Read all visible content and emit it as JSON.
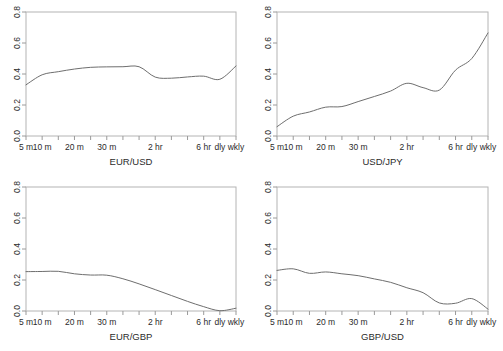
{
  "figure": {
    "panel_count": 4,
    "layout": "2x2",
    "background_color": "#ffffff",
    "line_color": "#6e6e6e",
    "axis_color": "#9a9a9a",
    "text_color": "#2b2b2b"
  },
  "axes": {
    "y_ticks": [
      "0.0",
      "0.2",
      "0.4",
      "0.6",
      "0.8"
    ],
    "y_tick_values": [
      0.0,
      0.2,
      0.4,
      0.6,
      0.8
    ],
    "ylim": [
      0.0,
      0.8
    ],
    "x_tick_labels": [
      "5 m",
      "10 m",
      "20 m",
      "30 m",
      "2 hr",
      "6 hr",
      "dly",
      "wkly"
    ],
    "x_labeled_indices": [
      0,
      1,
      3,
      5,
      8,
      11,
      12,
      13
    ],
    "x_category_count": 14,
    "grid": false,
    "legend": "none"
  },
  "chart_data": [
    {
      "type": "line",
      "title": "EUR/USD",
      "xlabel": "EUR/USD",
      "ylabel": "",
      "ylim": [
        0.0,
        0.8
      ],
      "categories": [
        "5 m",
        "10 m",
        "15 m",
        "20 m",
        "25 m",
        "30 m",
        "45 m",
        "1 hr",
        "2 hr",
        "3 hr",
        "4 hr",
        "6 hr",
        "dly",
        "wkly"
      ],
      "values": [
        0.33,
        0.395,
        0.415,
        0.432,
        0.443,
        0.446,
        0.447,
        0.447,
        0.38,
        0.373,
        0.381,
        0.386,
        0.366,
        0.452
      ]
    },
    {
      "type": "line",
      "title": "USD/JPY",
      "xlabel": "USD/JPY",
      "ylabel": "",
      "ylim": [
        0.0,
        0.8
      ],
      "categories": [
        "5 m",
        "10 m",
        "15 m",
        "20 m",
        "25 m",
        "30 m",
        "45 m",
        "1 hr",
        "2 hr",
        "3 hr",
        "4 hr",
        "6 hr",
        "dly",
        "wkly"
      ],
      "values": [
        0.06,
        0.128,
        0.155,
        0.186,
        0.19,
        0.222,
        0.255,
        0.29,
        0.34,
        0.312,
        0.296,
        0.425,
        0.5,
        0.665
      ]
    },
    {
      "type": "line",
      "title": "EUR/GBP",
      "xlabel": "EUR/GBP",
      "ylabel": "",
      "ylim": [
        0.0,
        0.8
      ],
      "categories": [
        "5 m",
        "10 m",
        "15 m",
        "20 m",
        "25 m",
        "30 m",
        "45 m",
        "1 hr",
        "2 hr",
        "3 hr",
        "4 hr",
        "6 hr",
        "dly",
        "wkly"
      ],
      "values": [
        0.254,
        0.255,
        0.256,
        0.24,
        0.232,
        0.231,
        0.208,
        0.175,
        0.138,
        0.1,
        0.062,
        0.028,
        0.002,
        0.018
      ]
    },
    {
      "type": "line",
      "title": "GBP/USD",
      "xlabel": "GBP/USD",
      "ylabel": "",
      "ylim": [
        0.0,
        0.8
      ],
      "categories": [
        "5 m",
        "10 m",
        "15 m",
        "20 m",
        "25 m",
        "30 m",
        "45 m",
        "1 hr",
        "2 hr",
        "3 hr",
        "4 hr",
        "6 hr",
        "dly",
        "wkly"
      ],
      "values": [
        0.262,
        0.272,
        0.243,
        0.252,
        0.24,
        0.228,
        0.207,
        0.185,
        0.15,
        0.118,
        0.052,
        0.05,
        0.08,
        0.012
      ]
    }
  ]
}
